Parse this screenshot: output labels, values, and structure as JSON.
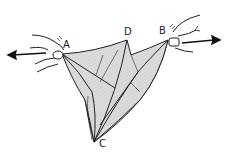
{
  "diagram": {
    "type": "origami-step",
    "labels": {
      "A": "A",
      "B": "B",
      "C": "C",
      "D": "D"
    },
    "arrows": [
      {
        "name": "pull-left-arrow",
        "direction": "left",
        "from": "A"
      },
      {
        "name": "pull-right-arrow",
        "direction": "right",
        "from": "B"
      }
    ],
    "colors": {
      "line": "#222222",
      "paper_fill": "#d9d9d9",
      "background": "#ffffff"
    }
  }
}
